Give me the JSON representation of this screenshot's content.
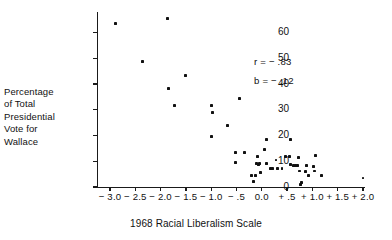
{
  "chart_data": {
    "type": "scatter",
    "title": "",
    "xlabel": "1968 Racial Liberalism Scale",
    "ylabel": "Percentage of Total Presidential Vote for Wallace",
    "ylabel_lines": [
      "Percentage",
      "of Total",
      "Presidential",
      "Vote for",
      "Wallace"
    ],
    "xlim": [
      -3.0,
      2.0
    ],
    "ylim": [
      0,
      68
    ],
    "grid": false,
    "legend": null,
    "xticks": [
      -3.0,
      -2.5,
      -2.0,
      -1.5,
      -1.0,
      -0.5,
      0.0,
      0.5,
      1.0,
      1.5,
      2.0
    ],
    "xticklabels": [
      "− 3.0",
      "− 2.5",
      "− 2.0",
      "− 1.5",
      "− 1.0",
      "− .5",
      "0.0",
      "+ .5",
      "+ 1.0",
      "+ 1.5",
      "+ 2.0"
    ],
    "yticks": [
      0,
      10,
      20,
      30,
      40,
      50,
      60
    ],
    "yticklabels": [
      "0",
      "10",
      "20",
      "30",
      "40",
      "50",
      "60"
    ],
    "annotations": [
      {
        "name": "correlation",
        "text": "r =  − .83",
        "x": 0.75,
        "y": 48
      },
      {
        "name": "slope",
        "text": "b =  − .12",
        "x": 0.75,
        "y": 41
      }
    ],
    "points": [
      {
        "x": -2.9,
        "y": 63.5
      },
      {
        "x": -1.87,
        "y": 65.5
      },
      {
        "x": -2.35,
        "y": 48.8
      },
      {
        "x": -1.5,
        "y": 43.4
      },
      {
        "x": -1.84,
        "y": 38.2
      },
      {
        "x": -1.72,
        "y": 31.6
      },
      {
        "x": -1.0,
        "y": 31.5
      },
      {
        "x": -0.97,
        "y": 29.1
      },
      {
        "x": -0.44,
        "y": 34.3
      },
      {
        "x": -0.67,
        "y": 23.8
      },
      {
        "x": -0.99,
        "y": 19.6
      },
      {
        "x": -0.52,
        "y": 13.3
      },
      {
        "x": -0.35,
        "y": 13.3
      },
      {
        "x": -0.52,
        "y": 9.5
      },
      {
        "x": -0.2,
        "y": 4.6
      },
      {
        "x": -0.13,
        "y": 4.5
      },
      {
        "x": -0.17,
        "y": 2.1
      },
      {
        "x": -0.09,
        "y": 11.8
      },
      {
        "x": -0.1,
        "y": 9.3
      },
      {
        "x": -0.07,
        "y": 8.8
      },
      {
        "x": -0.05,
        "y": 9.3
      },
      {
        "x": -0.02,
        "y": 5.8
      },
      {
        "x": 0.05,
        "y": 14.7
      },
      {
        "x": 0.1,
        "y": 18.4
      },
      {
        "x": 0.1,
        "y": 9.0
      },
      {
        "x": 0.17,
        "y": 7.3
      },
      {
        "x": 0.22,
        "y": 7.3
      },
      {
        "x": 0.28,
        "y": 10.5
      },
      {
        "x": 0.31,
        "y": 7.2
      },
      {
        "x": 0.4,
        "y": 7.2
      },
      {
        "x": 0.47,
        "y": 11.9
      },
      {
        "x": 0.54,
        "y": 11.9
      },
      {
        "x": 0.56,
        "y": 18.6
      },
      {
        "x": 0.56,
        "y": 8.6
      },
      {
        "x": 0.62,
        "y": 8.4
      },
      {
        "x": 0.66,
        "y": 8.5
      },
      {
        "x": 0.7,
        "y": 8.5
      },
      {
        "x": 0.72,
        "y": 11.3
      },
      {
        "x": 0.74,
        "y": 6.2
      },
      {
        "x": 0.78,
        "y": 1.9
      },
      {
        "x": 0.76,
        "y": 0.9
      },
      {
        "x": 0.86,
        "y": 5.9
      },
      {
        "x": 0.88,
        "y": 8.4
      },
      {
        "x": 0.92,
        "y": 4.4
      },
      {
        "x": 1.02,
        "y": 8.1
      },
      {
        "x": 1.06,
        "y": 12.1
      },
      {
        "x": 1.04,
        "y": 6.2
      },
      {
        "x": 1.18,
        "y": 4.5
      },
      {
        "x": 2.0,
        "y": 3.5
      }
    ]
  }
}
